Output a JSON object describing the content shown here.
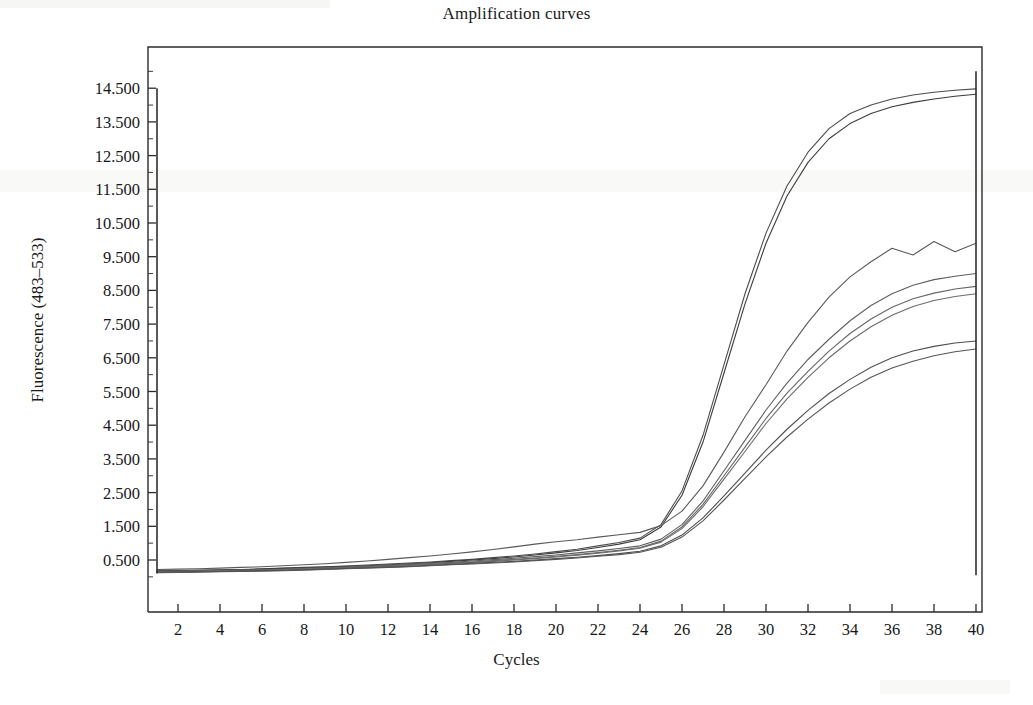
{
  "figure": {
    "title": "Amplification curves",
    "xlabel": "Cycles",
    "ylabel": "Fluorescence (483–533)"
  },
  "chart_data": {
    "type": "line",
    "title": "Amplification curves",
    "xlabel": "Cycles",
    "ylabel": "Fluorescence (483–533)",
    "xlim": [
      1,
      40
    ],
    "ylim": [
      -1.0,
      15.2
    ],
    "grid": false,
    "legend": "none",
    "xticks": [
      2,
      4,
      6,
      8,
      10,
      12,
      14,
      16,
      18,
      20,
      22,
      24,
      26,
      28,
      30,
      32,
      34,
      36,
      38,
      40
    ],
    "xtick_labels": [
      "2",
      "4",
      "6",
      "8",
      "10",
      "12",
      "14",
      "16",
      "18",
      "20",
      "22",
      "24",
      "26",
      "28",
      "30",
      "32",
      "34",
      "36",
      "38",
      "40"
    ],
    "yticks": [
      0.5,
      1.5,
      2.5,
      3.5,
      4.5,
      5.5,
      6.5,
      7.5,
      8.5,
      9.5,
      10.5,
      11.5,
      12.5,
      13.5,
      14.5
    ],
    "ytick_labels": [
      "0.500",
      "1.500",
      "2.500",
      "3.500",
      "4.500",
      "5.500",
      "6.500",
      "7.500",
      "8.500",
      "9.500",
      "10.500",
      "11.500",
      "12.500",
      "13.500",
      "14.500"
    ],
    "x": [
      1,
      2,
      3,
      4,
      5,
      6,
      7,
      8,
      9,
      10,
      11,
      12,
      13,
      14,
      15,
      16,
      17,
      18,
      19,
      20,
      21,
      22,
      23,
      24,
      25,
      26,
      27,
      28,
      29,
      30,
      31,
      32,
      33,
      34,
      35,
      36,
      37,
      38,
      39,
      40
    ],
    "series": [
      {
        "name": "curve-1-high-plateau",
        "color": "#4c4c4c",
        "values": [
          0.18,
          0.19,
          0.2,
          0.21,
          0.22,
          0.24,
          0.26,
          0.28,
          0.3,
          0.32,
          0.35,
          0.38,
          0.41,
          0.44,
          0.48,
          0.52,
          0.57,
          0.62,
          0.68,
          0.75,
          0.82,
          0.92,
          1.02,
          1.15,
          1.55,
          2.55,
          4.2,
          6.3,
          8.4,
          10.2,
          11.6,
          12.6,
          13.3,
          13.75,
          14.0,
          14.18,
          14.3,
          14.38,
          14.44,
          14.48
        ]
      },
      {
        "name": "curve-2-high-plateau",
        "color": "#3c3c3c",
        "values": [
          0.17,
          0.18,
          0.19,
          0.2,
          0.21,
          0.23,
          0.25,
          0.27,
          0.29,
          0.31,
          0.33,
          0.36,
          0.39,
          0.42,
          0.46,
          0.5,
          0.54,
          0.59,
          0.65,
          0.71,
          0.78,
          0.87,
          0.97,
          1.1,
          1.48,
          2.42,
          4.0,
          6.05,
          8.1,
          9.9,
          11.3,
          12.3,
          13.0,
          13.45,
          13.75,
          13.95,
          14.08,
          14.18,
          14.26,
          14.32
        ]
      },
      {
        "name": "curve-3-mid-high",
        "color": "#5a5a5a",
        "values": [
          0.22,
          0.23,
          0.24,
          0.26,
          0.28,
          0.3,
          0.33,
          0.36,
          0.39,
          0.43,
          0.47,
          0.52,
          0.57,
          0.62,
          0.68,
          0.74,
          0.81,
          0.89,
          0.97,
          1.04,
          1.1,
          1.18,
          1.25,
          1.32,
          1.52,
          1.95,
          2.7,
          3.7,
          4.75,
          5.7,
          6.7,
          7.55,
          8.3,
          8.9,
          9.35,
          9.75,
          9.55,
          9.95,
          9.65,
          9.9
        ]
      },
      {
        "name": "curve-4-mid",
        "color": "#5f5f5f",
        "values": [
          0.16,
          0.17,
          0.18,
          0.19,
          0.2,
          0.21,
          0.23,
          0.25,
          0.27,
          0.29,
          0.31,
          0.34,
          0.37,
          0.4,
          0.43,
          0.47,
          0.51,
          0.55,
          0.6,
          0.65,
          0.71,
          0.77,
          0.84,
          0.92,
          1.12,
          1.55,
          2.25,
          3.15,
          4.05,
          4.95,
          5.75,
          6.45,
          7.05,
          7.6,
          8.05,
          8.4,
          8.65,
          8.82,
          8.92,
          9.0
        ]
      },
      {
        "name": "curve-5-mid-low",
        "color": "#666666",
        "values": [
          0.15,
          0.16,
          0.17,
          0.18,
          0.19,
          0.2,
          0.22,
          0.24,
          0.26,
          0.28,
          0.3,
          0.32,
          0.35,
          0.38,
          0.41,
          0.44,
          0.48,
          0.52,
          0.56,
          0.61,
          0.66,
          0.72,
          0.79,
          0.87,
          1.06,
          1.48,
          2.15,
          3.0,
          3.85,
          4.7,
          5.45,
          6.1,
          6.7,
          7.22,
          7.65,
          8.0,
          8.25,
          8.42,
          8.54,
          8.62
        ]
      },
      {
        "name": "curve-6-mid-low",
        "color": "#6b6b6b",
        "values": [
          0.14,
          0.15,
          0.16,
          0.17,
          0.18,
          0.19,
          0.21,
          0.23,
          0.25,
          0.27,
          0.29,
          0.31,
          0.34,
          0.37,
          0.4,
          0.43,
          0.46,
          0.5,
          0.54,
          0.59,
          0.64,
          0.7,
          0.77,
          0.85,
          1.03,
          1.43,
          2.08,
          2.9,
          3.72,
          4.55,
          5.28,
          5.92,
          6.5,
          7.0,
          7.42,
          7.76,
          8.02,
          8.2,
          8.32,
          8.4
        ]
      },
      {
        "name": "curve-7-low",
        "color": "#4f4f4f",
        "values": [
          0.13,
          0.14,
          0.15,
          0.16,
          0.17,
          0.18,
          0.19,
          0.21,
          0.23,
          0.25,
          0.27,
          0.29,
          0.31,
          0.34,
          0.37,
          0.4,
          0.43,
          0.46,
          0.5,
          0.54,
          0.58,
          0.63,
          0.69,
          0.76,
          0.92,
          1.24,
          1.75,
          2.4,
          3.08,
          3.76,
          4.38,
          4.94,
          5.44,
          5.86,
          6.22,
          6.5,
          6.7,
          6.84,
          6.94,
          7.0
        ]
      },
      {
        "name": "curve-8-low",
        "color": "#555555",
        "values": [
          0.12,
          0.13,
          0.14,
          0.15,
          0.16,
          0.17,
          0.18,
          0.2,
          0.22,
          0.24,
          0.26,
          0.28,
          0.3,
          0.33,
          0.36,
          0.38,
          0.41,
          0.44,
          0.48,
          0.52,
          0.56,
          0.61,
          0.66,
          0.73,
          0.88,
          1.18,
          1.66,
          2.28,
          2.92,
          3.56,
          4.15,
          4.68,
          5.16,
          5.57,
          5.92,
          6.2,
          6.4,
          6.56,
          6.68,
          6.76
        ]
      }
    ],
    "annotations": [
      {
        "name": "cycle-1-vertical-marker",
        "x": 1,
        "y_from": 0.1,
        "y_to": 14.5
      },
      {
        "name": "cycle-40-vertical-marker",
        "x": 40,
        "y_from": 0.05,
        "y_to": 15.0
      }
    ]
  },
  "axes_geometry": {
    "plot_left_px": 148,
    "plot_right_px": 982,
    "plot_top_px": 47,
    "plot_bottom_px": 612,
    "x_at_cycle2_px": 178,
    "px_per_cycle": 21.0,
    "y_at_0_500_px": 560,
    "px_per_unit": 33.7
  }
}
